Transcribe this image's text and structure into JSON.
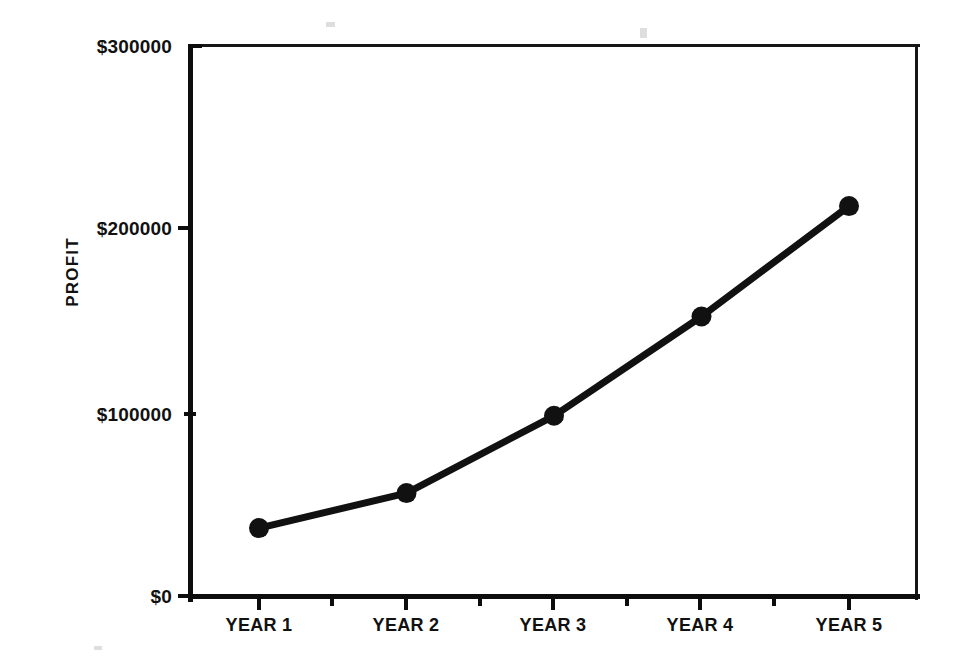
{
  "chart_data": {
    "type": "line",
    "title": "",
    "xlabel": "",
    "ylabel": "PROFIT",
    "categories": [
      "YEAR 1",
      "YEAR 2",
      "YEAR 3",
      "YEAR 4",
      "YEAR 5"
    ],
    "values": [
      38000,
      57000,
      99000,
      153000,
      213000
    ],
    "ylim": [
      0,
      300000
    ],
    "ytick_values": [
      0,
      100000,
      200000,
      300000
    ],
    "ytick_labels": [
      "$0",
      "$100000",
      "$200000",
      "$300000"
    ],
    "grid": false,
    "legend": null,
    "series": [
      {
        "name": "PROFIT",
        "color": "#111111",
        "marker": "circle",
        "values": [
          38000,
          57000,
          99000,
          153000,
          213000
        ]
      }
    ]
  },
  "axes": {
    "y_axis_title": "PROFIT",
    "y_ticks": [
      {
        "label": "$300000",
        "value": 300000
      },
      {
        "label": "$200000",
        "value": 200000
      },
      {
        "label": "$100000",
        "value": 100000
      },
      {
        "label": "$0",
        "value": 0
      }
    ],
    "x_ticks": [
      {
        "label": "YEAR 1"
      },
      {
        "label": "YEAR 2"
      },
      {
        "label": "YEAR 3"
      },
      {
        "label": "YEAR 4"
      },
      {
        "label": "YEAR 5"
      }
    ]
  },
  "colors": {
    "line": "#111111",
    "marker": "#111111",
    "axis": "#0d0d0d",
    "frame": "#171717",
    "background": "#ffffff"
  }
}
